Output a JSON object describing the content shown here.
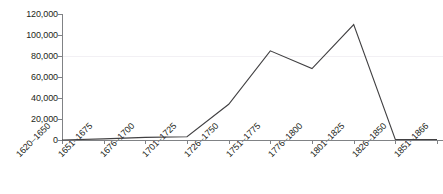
{
  "chart_data": {
    "type": "line",
    "title": "",
    "subtitle": "",
    "xlabel": "",
    "ylabel": "",
    "categories": [
      "1620–1650",
      "1651–1675",
      "1676–1700",
      "1701–1725",
      "1726–1750",
      "1751–1775",
      "1776–1800",
      "1801–1825",
      "1826–1850",
      "1851–1866"
    ],
    "values": [
      0,
      1000,
      2500,
      3000,
      34000,
      85000,
      68000,
      110000,
      500,
      500
    ],
    "ytick_labels": [
      "120,000",
      "100,000",
      "80,000",
      "60,000",
      "40,000",
      "20,000",
      "0"
    ],
    "ytick_values": [
      120000,
      100000,
      80000,
      60000,
      40000,
      20000,
      0
    ],
    "ylim": [
      0,
      120000
    ],
    "grid": "horizontal-faint-at-80000",
    "gridline_values": [
      80000
    ],
    "legend": [],
    "legend_position": "none",
    "annotations": [],
    "colors": {
      "line": "#414042",
      "axis": "#808285",
      "text": "#231f20",
      "gridline": "#f2f0f4",
      "background": "#ffffff"
    }
  }
}
